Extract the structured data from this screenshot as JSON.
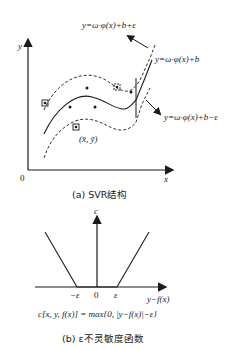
{
  "figure_a": {
    "axis_y_label": "y",
    "axis_x_label": "x",
    "origin_label": "0",
    "upper_bound_label": "y=ω·φ(x)+b+ε",
    "regression_label": "y=ω·φ(x)+b",
    "lower_bound_label": "y=ω·φ(x)+b−ε",
    "support_point_label": "(x̄, ȳ)",
    "caption": "(a)  SVR结构"
  },
  "figure_b": {
    "axis_y_label": "c",
    "axis_x_label": "y−f(x)",
    "tick_neg_eps": "−ε",
    "tick_zero": "0",
    "tick_eps": "ε",
    "formula": "c[x, y, f(x)] = max{0, |y−f(x)|−ε}",
    "caption": "(b)  ε不灵敏度函数"
  },
  "colors": {
    "ink": "#1a1a1a",
    "background": "#ffffff"
  }
}
